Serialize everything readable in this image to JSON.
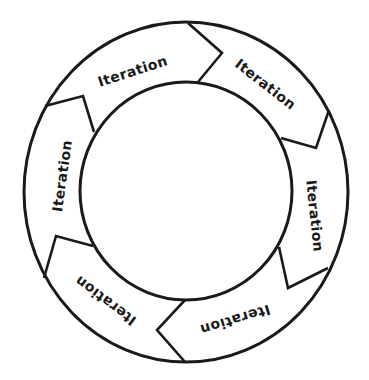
{
  "diagram": {
    "type": "cycle",
    "colors": {
      "stroke": "#1a1a1a",
      "background": "#ffffff",
      "text": "#1a1a1a"
    },
    "segments": [
      {
        "label": "Iteration",
        "position": "top-left"
      },
      {
        "label": "Iteration",
        "position": "top-right"
      },
      {
        "label": "Iteration",
        "position": "right"
      },
      {
        "label": "Iteration",
        "position": "bottom-right"
      },
      {
        "label": "Iteration",
        "position": "bottom-left"
      },
      {
        "label": "Iteration",
        "position": "left"
      }
    ]
  }
}
